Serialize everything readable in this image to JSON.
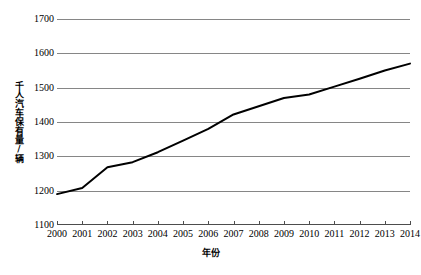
{
  "chart_data": {
    "type": "line",
    "title": "",
    "xlabel": "年份",
    "ylabel": "千人汽车保有量/辆",
    "categories": [
      2000,
      2001,
      2002,
      2003,
      2004,
      2005,
      2006,
      2007,
      2008,
      2009,
      2010,
      2011,
      2012,
      2013,
      2014
    ],
    "x_tick_labels": [
      "2000",
      "2001",
      "2002",
      "2003",
      "2004",
      "2005",
      "2006",
      "2007",
      "2008",
      "2009",
      "2010",
      "2011",
      "2012",
      "2013",
      "2014"
    ],
    "values": [
      1190,
      1208,
      1268,
      1283,
      1312,
      1346,
      1380,
      1422,
      1446,
      1470,
      1480,
      1503,
      1526,
      1550,
      1570
    ],
    "series": [
      {
        "name": "千人汽车保有量",
        "values": [
          1190,
          1208,
          1268,
          1283,
          1312,
          1346,
          1380,
          1422,
          1446,
          1470,
          1480,
          1503,
          1526,
          1550,
          1570
        ]
      }
    ],
    "ylim": [
      1100,
      1700
    ],
    "y_ticks": [
      1100,
      1200,
      1300,
      1400,
      1500,
      1600,
      1700
    ],
    "y_tick_labels": [
      "1100",
      "1200",
      "1300",
      "1400",
      "1500",
      "1600",
      "1700"
    ],
    "xlim": [
      2000,
      2014
    ],
    "grid": "horizontal",
    "legend": "none",
    "colors": {
      "line": "#000000",
      "gridline": "#868686",
      "axis": "#4d4d4d",
      "background": "#ffffff"
    },
    "line_width": 2
  }
}
